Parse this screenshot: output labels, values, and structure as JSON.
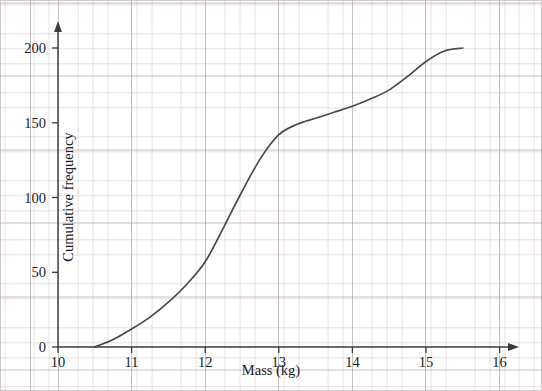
{
  "chart_data": {
    "type": "line",
    "title": "",
    "subtitle": "",
    "xlabel": "Mass (kg)",
    "ylabel": "Cumulative frequency",
    "xlim": [
      10,
      16.3
    ],
    "ylim": [
      0,
      215
    ],
    "xticks": [
      10,
      11,
      12,
      13,
      14,
      15,
      16
    ],
    "xtick_labels": [
      "10",
      "11",
      "12",
      "13",
      "14",
      "15",
      "16"
    ],
    "yticks": [
      0,
      50,
      100,
      150,
      200
    ],
    "ytick_labels": [
      "0",
      "50",
      "100",
      "150",
      "200"
    ],
    "grid": "graph-paper minor and major gridlines",
    "legend": "none",
    "series": [
      {
        "name": "Cumulative frequency",
        "color": "#4a4a4a",
        "x": [
          10.5,
          10.75,
          11.0,
          11.25,
          11.5,
          11.75,
          12.0,
          12.25,
          12.5,
          12.75,
          13.0,
          13.25,
          13.5,
          13.75,
          14.0,
          14.25,
          14.5,
          14.75,
          15.0,
          15.25,
          15.5
        ],
        "y": [
          0,
          5,
          12,
          20,
          30,
          42,
          57,
          80,
          104,
          126,
          142,
          149,
          153,
          157,
          161,
          166,
          172,
          181,
          191,
          198,
          200
        ]
      }
    ],
    "annotations": [
      "Curve starts at (10.5, 0)",
      "Steepest rise between 12.0 and 13.0",
      "Plateau near 200 from 15.25 to 15.5"
    ]
  },
  "axes": {
    "x_title": "Mass (kg)",
    "y_title": "Cumulative frequency",
    "x_labels": [
      "10",
      "11",
      "12",
      "13",
      "14",
      "15",
      "16"
    ],
    "y_labels": [
      "0",
      "50",
      "100",
      "150",
      "200"
    ]
  },
  "colors": {
    "curve": "#4a4a4a",
    "axis": "#3a3a3a",
    "grid_minor": "#c8b2ba",
    "grid_major": "#968c96",
    "background": "#ffffff"
  }
}
